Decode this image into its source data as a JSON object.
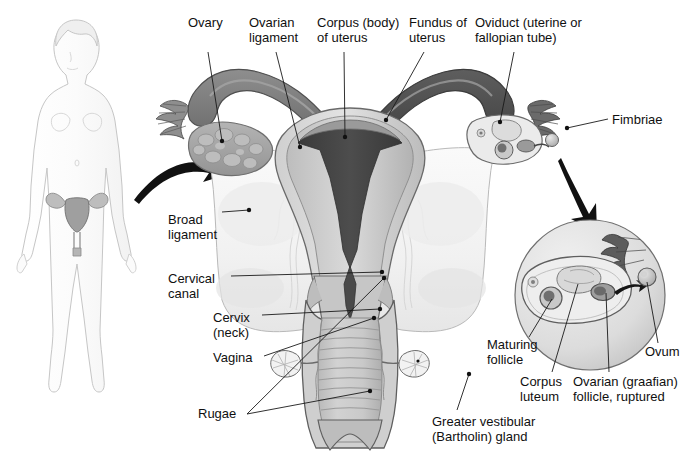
{
  "figure": {
    "type": "anatomical-illustration",
    "width": 698,
    "height": 462,
    "background_color": "#ffffff",
    "label_text_color": "#101010",
    "leader_line_color": "#1a1a1a",
    "arrow_color": "#111111"
  },
  "palette": {
    "outline": "#5a5a5a",
    "body_outline": "#c9c9c9",
    "body_fill": "#fdfdfd",
    "broad_ligament": "#f4f4f4",
    "myometrium_light": "#d6d6d6",
    "myometrium_mid": "#b8b8b8",
    "endometrium_dark": "#4a4a4a",
    "uterine_cavity": "#3b3b3b",
    "ovary_fill": "#a8a8a8",
    "ovary_follicle": "#bdbdbd",
    "oviduct_dark": "#6f6f6f",
    "oviduct_darkest": "#4f4f4f",
    "vagina_wall": "#c2c2c2",
    "vagina_lumen": "#b0b0b0",
    "rugae_line": "#8d8d8d",
    "inset_circle_fill": "#e4e4e4",
    "inset_circle_edge": "#7a7a7a",
    "bartholin_gland": "#efefef"
  },
  "labels": [
    {
      "id": "ovary",
      "text": "Ovary",
      "x": 188,
      "y": 16,
      "align": "left"
    },
    {
      "id": "ovarian-ligament",
      "text": "Ovarian\nligament",
      "x": 249,
      "y": 16,
      "align": "left"
    },
    {
      "id": "corpus-uterus",
      "text": "Corpus (body)\nof uterus",
      "x": 317,
      "y": 16,
      "align": "left"
    },
    {
      "id": "fundus-uterus",
      "text": "Fundus of\nuterus",
      "x": 409,
      "y": 16,
      "align": "left"
    },
    {
      "id": "oviduct",
      "text": "Oviduct (uterine or\nfallopian tube)",
      "x": 475,
      "y": 16,
      "align": "left"
    },
    {
      "id": "fimbriae",
      "text": "Fimbriae",
      "x": 612,
      "y": 113,
      "align": "left"
    },
    {
      "id": "broad-ligament",
      "text": "Broad\nligament",
      "x": 168,
      "y": 213,
      "align": "left"
    },
    {
      "id": "cervical-canal",
      "text": "Cervical\ncanal",
      "x": 168,
      "y": 272,
      "align": "left"
    },
    {
      "id": "cervix-neck",
      "text": "Cervix\n(neck)",
      "x": 213,
      "y": 311,
      "align": "left"
    },
    {
      "id": "vagina",
      "text": "Vagina",
      "x": 213,
      "y": 351,
      "align": "left"
    },
    {
      "id": "rugae",
      "text": "Rugae",
      "x": 198,
      "y": 414,
      "align": "left"
    },
    {
      "id": "greater-vestibular",
      "text": "Greater vestibular\n(Bartholin) gland",
      "x": 432,
      "y": 415,
      "align": "left"
    },
    {
      "id": "maturing-follicle",
      "text": "Maturing\nfollicle",
      "x": 487,
      "y": 338,
      "align": "left"
    },
    {
      "id": "corpus-luteum",
      "text": "Corpus\nluteum",
      "x": 520,
      "y": 375,
      "align": "left"
    },
    {
      "id": "ovarian-graafian",
      "text": "Ovarian (graafian)\nfollicle, ruptured",
      "x": 573,
      "y": 375,
      "align": "left"
    },
    {
      "id": "ovum",
      "text": "Ovum",
      "x": 645,
      "y": 345,
      "align": "left"
    }
  ],
  "leader_lines": [
    {
      "id": "leader-ovary",
      "points": "208,52 222,143"
    },
    {
      "id": "leader-ovarian-ligament",
      "points": "276,52 300,148"
    },
    {
      "id": "leader-corpus-uterus",
      "points": "344,52 345,138"
    },
    {
      "id": "leader-fundus-uterus",
      "points": "424,52 385,120"
    },
    {
      "id": "leader-oviduct",
      "points": "514,52 500,123"
    },
    {
      "id": "leader-fimbriae",
      "points": "608,119 566,128"
    },
    {
      "id": "leader-broad-ligament",
      "points": "221,213 249,211"
    },
    {
      "id": "leader-cervical-canal",
      "points": "230,276 383,272"
    },
    {
      "id": "leader-cervix",
      "points": "261,315 381,309"
    },
    {
      "id": "leader-vagina",
      "points": "263,355 374,318"
    },
    {
      "id": "leader-rugae-a",
      "points": "246,413 370,390"
    },
    {
      "id": "leader-rugae-b",
      "points": "246,413 383,277"
    },
    {
      "id": "leader-bartholin",
      "points": "456,410 469,373"
    },
    {
      "id": "leader-maturing-follicle",
      "points": "528,336 552,298"
    },
    {
      "id": "leader-corpus-luteum",
      "points": "551,372 578,283"
    },
    {
      "id": "leader-graafian",
      "points": "608,372 607,292"
    },
    {
      "id": "leader-ovum",
      "points": "657,342 646,281"
    }
  ],
  "annotations": {
    "overview_arrow": {
      "id": "overview-arrow",
      "description": "curved arrow from whole-body figure to enlarged uterus view",
      "direction": "left-to-right"
    },
    "inset_arrow": {
      "id": "inset-arrow",
      "description": "arrow from ovary on the illustration down to the magnified ovary inset circle",
      "direction": "upper-left-to-lower-right"
    },
    "ovulation_arrow": {
      "id": "ovulation-arrow",
      "description": "small curved arrow inside the inset showing ovum released from ruptured follicle",
      "direction": "left-to-right"
    }
  },
  "structures": [
    {
      "id": "whole-body-figure",
      "name": "Whole body female figure with reproductive organs highlighted"
    },
    {
      "id": "uterus-corpus",
      "name": "Corpus (body) of uterus"
    },
    {
      "id": "uterus-fundus",
      "name": "Fundus of uterus"
    },
    {
      "id": "uterine-cavity",
      "name": "Uterine cavity (endometrial lining)"
    },
    {
      "id": "left-ovary",
      "name": "Left ovary with follicles"
    },
    {
      "id": "right-ovary-cut",
      "name": "Right ovary, sectioned"
    },
    {
      "id": "left-oviduct",
      "name": "Left oviduct (fallopian tube)"
    },
    {
      "id": "right-oviduct",
      "name": "Right oviduct (fallopian tube)"
    },
    {
      "id": "fimbriae-left",
      "name": "Fimbriae of left oviduct"
    },
    {
      "id": "fimbriae-right",
      "name": "Fimbriae of right oviduct"
    },
    {
      "id": "broad-ligament",
      "name": "Broad ligament"
    },
    {
      "id": "cervix",
      "name": "Cervix (neck)"
    },
    {
      "id": "cervical-canal",
      "name": "Cervical canal"
    },
    {
      "id": "vagina",
      "name": "Vagina with rugae"
    },
    {
      "id": "bartholin-left",
      "name": "Left greater vestibular (Bartholin) gland"
    },
    {
      "id": "bartholin-right",
      "name": "Right greater vestibular (Bartholin) gland"
    },
    {
      "id": "ovary-inset",
      "name": "Magnified ovary inset circle"
    }
  ]
}
